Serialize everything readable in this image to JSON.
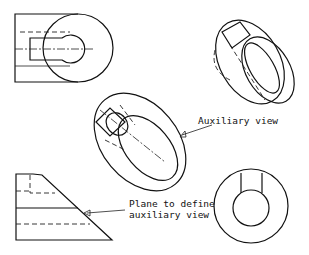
{
  "diagram": {
    "labels": {
      "auxiliary_view": "Auxiliary view",
      "plane_line1": "Plane to define",
      "plane_line2": "auxiliary view"
    },
    "views": [
      "front-view",
      "isometric-view",
      "auxiliary-view",
      "side-view",
      "end-view"
    ],
    "colors": {
      "stroke": "#111111",
      "background": "#ffffff"
    }
  }
}
